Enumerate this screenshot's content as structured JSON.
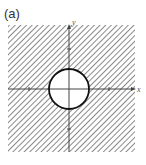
{
  "figure": {
    "panel_label": "(a)",
    "x_axis_label": "x",
    "y_axis_label": "y",
    "circle": {
      "center": [
        0,
        0
      ],
      "radius": 1
    },
    "shading": "diagonal hatch outside circle",
    "colors": {
      "hatch": "#8a8a8a",
      "axis": "#444444",
      "circle": "#111111",
      "background": "#ffffff"
    }
  }
}
